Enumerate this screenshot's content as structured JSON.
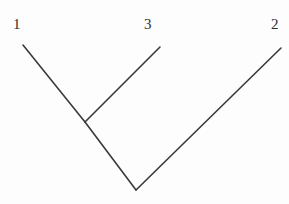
{
  "figure": {
    "type": "phylogenetic-tree",
    "background_color": "#fdfdfd",
    "line_color": "#3a3a3a",
    "label_color": "#2e2e2e",
    "width": 289,
    "height": 204
  },
  "labels": {
    "taxon_1": "1",
    "taxon_3": "3",
    "taxon_2": "2"
  },
  "tree": {
    "nodes": {
      "tip_1": {
        "x": 23,
        "y": 45
      },
      "tip_3": {
        "x": 160,
        "y": 47
      },
      "tip_2": {
        "x": 281,
        "y": 48
      },
      "internal_node": {
        "x": 85,
        "y": 122
      },
      "root_node": {
        "x": 136,
        "y": 190
      }
    },
    "branches": [
      {
        "name": "branch-taxon-1",
        "from": "tip_1",
        "to": "internal_node"
      },
      {
        "name": "branch-taxon-3",
        "from": "tip_3",
        "to": "internal_node"
      },
      {
        "name": "branch-stem",
        "from": "internal_node",
        "to": "root_node"
      },
      {
        "name": "branch-taxon-2",
        "from": "root_node",
        "to": "tip_2"
      }
    ]
  }
}
